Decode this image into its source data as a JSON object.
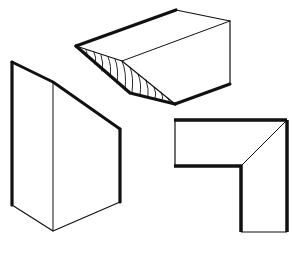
{
  "figure": {
    "colors": {
      "background": "#ffffff",
      "stroke": "#111111"
    },
    "shapes": [
      {
        "id": "wedge-prism",
        "label": ""
      },
      {
        "id": "tall-prism",
        "label": ""
      },
      {
        "id": "mitred-corner",
        "label": ""
      }
    ]
  }
}
